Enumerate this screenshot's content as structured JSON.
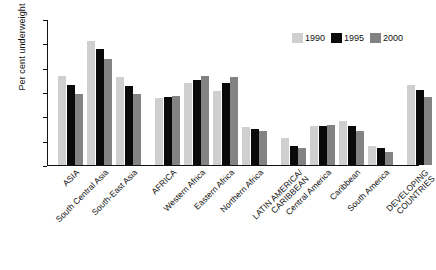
{
  "chart_data": {
    "type": "bar",
    "title": "",
    "xlabel": "",
    "ylabel": "Per cent underweight",
    "ylim": [
      0,
      60
    ],
    "yticks": [
      0,
      10,
      20,
      30,
      40,
      50,
      60
    ],
    "ytick_labels": [
      "0",
      "10",
      "20",
      "30",
      "40",
      "50",
      "60"
    ],
    "grid": false,
    "legend_position": "top-right",
    "categories": [
      "ASIA",
      "South Central Asia",
      "South-East Asia",
      "AFRICA",
      "Western Africa",
      "Eastern Africa",
      "Northern Africa",
      "LATIN AMERICA/\nCARIBBEAN",
      "Central America",
      "Caribbean",
      "South America",
      "DEVELOPING\nCOUNTRIES"
    ],
    "series": [
      {
        "name": "1990",
        "color": "#cfcfcf",
        "values": [
          36.5,
          51.0,
          36.0,
          27.5,
          33.5,
          30.5,
          15.5,
          11.0,
          16.0,
          18.0,
          8.0,
          33.0
        ]
      },
      {
        "name": "1995",
        "color": "#0a0a0a",
        "values": [
          33.0,
          47.5,
          32.5,
          28.0,
          35.0,
          33.5,
          15.0,
          8.0,
          16.0,
          16.0,
          7.0,
          31.0
        ]
      },
      {
        "name": "2000",
        "color": "#838383",
        "values": [
          29.0,
          43.5,
          29.0,
          28.5,
          36.5,
          36.0,
          14.0,
          7.0,
          16.5,
          14.0,
          5.5,
          28.0
        ]
      }
    ]
  },
  "legend": {
    "items": [
      {
        "label": "1990",
        "color": "#cfcfcf"
      },
      {
        "label": "1995",
        "color": "#0a0a0a"
      },
      {
        "label": "2000",
        "color": "#838383"
      }
    ]
  }
}
